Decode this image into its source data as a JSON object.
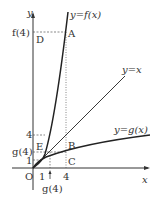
{
  "diagram": {
    "axes": {
      "x_label": "x",
      "y_label": "y",
      "origin_label": "O"
    },
    "curves": {
      "f": "y=f(x)",
      "identity": "y=x",
      "g": "y=g(x)"
    },
    "points": {
      "A": "A",
      "B": "B",
      "C": "C",
      "D": "D",
      "E": "E"
    },
    "y_ticks": {
      "f4": "f(4)",
      "four": "4",
      "g4": "g(4)",
      "one": "1"
    },
    "x_ticks": {
      "one": "1",
      "four": "4",
      "g4": "g(4)"
    },
    "colors": {
      "line": "#222222",
      "dashed": "#555555"
    }
  }
}
